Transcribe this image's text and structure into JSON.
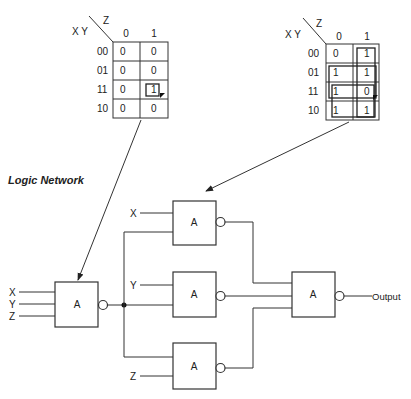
{
  "section_label": "Logic Network",
  "kmap_left": {
    "var_col": "Z",
    "var_row": "X Y",
    "col_headers": [
      "0",
      "1"
    ],
    "row_headers": [
      "00",
      "01",
      "11",
      "10"
    ],
    "cells": [
      [
        "0",
        "0"
      ],
      [
        "0",
        "0"
      ],
      [
        "0",
        "1"
      ],
      [
        "0",
        "0"
      ]
    ],
    "groups": [
      "row 11, Z=1 (single cell)"
    ]
  },
  "kmap_right": {
    "var_col": "Z",
    "var_row": "X Y",
    "col_headers": [
      "0",
      "1"
    ],
    "row_headers": [
      "00",
      "01",
      "11",
      "10"
    ],
    "cells": [
      [
        "0",
        "1"
      ],
      [
        "1",
        "1"
      ],
      [
        "1",
        "0"
      ],
      [
        "1",
        "1"
      ]
    ],
    "groups": [
      "column Z=1 (rows 00-10)",
      "row 01 (both columns)",
      "rows 11-10 (both columns)"
    ]
  },
  "gates": {
    "input_gate": {
      "label": "A",
      "inputs": [
        "X",
        "Y",
        "Z"
      ]
    },
    "gate_top": {
      "label": "A",
      "inputs": [
        "X"
      ]
    },
    "gate_mid": {
      "label": "A",
      "inputs": [
        "Y"
      ]
    },
    "gate_bottom": {
      "label": "A",
      "inputs": [
        "Z"
      ]
    },
    "output_gate": {
      "label": "A",
      "output": "Output"
    }
  }
}
